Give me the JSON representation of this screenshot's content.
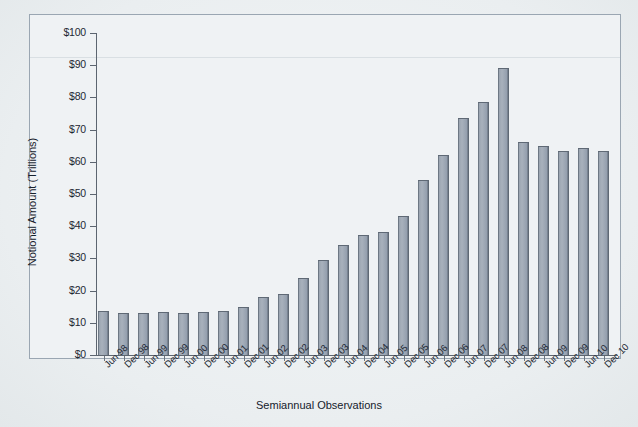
{
  "chart_data": {
    "type": "bar",
    "title": "",
    "xlabel": "Semiannual Observations",
    "ylabel": "Notional Amount (Trillions)",
    "ylim": [
      0,
      100
    ],
    "ytick_step": 10,
    "ytick_labels": [
      "$0",
      "$10",
      "$20",
      "$30",
      "$40",
      "$50",
      "$60",
      "$70",
      "$80",
      "$90",
      "$100"
    ],
    "ytick_values": [
      0,
      10,
      20,
      30,
      40,
      50,
      60,
      70,
      80,
      90,
      100
    ],
    "grid": false,
    "legend": "none",
    "bar_color": "#99a3af",
    "bar_edge_color": "#5f6975",
    "categories": [
      "Jun 98",
      "Dec 98",
      "Jun 99",
      "Dec 99",
      "Jun 00",
      "Dec 00",
      "Jun 01",
      "Dec 01",
      "Jun 02",
      "Dec 02",
      "Jun 03",
      "Dec 03",
      "Jun 04",
      "Dec 04",
      "Jun 05",
      "Dec 05",
      "Jun 06",
      "Dec 06",
      "Jun 07",
      "Dec 07",
      "Jun 08",
      "Dec 08",
      "Jun 09",
      "Dec 09",
      "Jun 10",
      "Dec 10"
    ],
    "values": [
      13.8,
      13.0,
      13.0,
      13.3,
      13.1,
      13.5,
      13.6,
      15.0,
      18.0,
      19.0,
      24.0,
      29.6,
      34.2,
      37.2,
      38.2,
      43.2,
      54.5,
      62.0,
      73.5,
      78.5,
      89.0,
      66.0,
      65.0,
      63.2,
      64.2,
      63.5
    ]
  },
  "axes": {
    "y_title": "Notional Amount (Trillions)",
    "x_title": "Semiannual Observations"
  }
}
